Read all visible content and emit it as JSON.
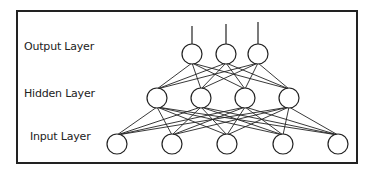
{
  "diagram": {
    "colors": {
      "stroke": "#222222",
      "background": "#ffffff",
      "node_fill": "#ffffff"
    },
    "layers": [
      {
        "name": "Output Layer",
        "label_x": 24,
        "label_y": 46,
        "node_y": 54,
        "nodes_x": [
          192,
          226,
          258
        ],
        "stems_top_y": [
          26,
          24,
          22
        ]
      },
      {
        "name": "Hidden Layer",
        "label_x": 24,
        "label_y": 93,
        "node_y": 98,
        "nodes_x": [
          157,
          201,
          245,
          289
        ]
      },
      {
        "name": "Input Layer",
        "label_x": 30,
        "label_y": 136,
        "node_y": 144,
        "nodes_x": [
          117,
          172,
          227,
          283,
          338
        ]
      }
    ],
    "node_radius": 10,
    "connections": "fully-connected between adjacent layers"
  }
}
